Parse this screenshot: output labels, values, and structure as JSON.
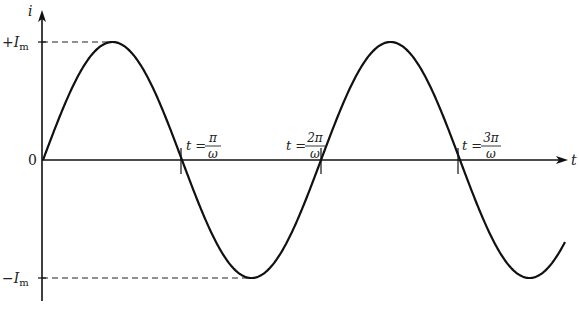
{
  "diagram": {
    "type": "sine-wave",
    "axes": {
      "y_label": "i",
      "x_label": "t",
      "y_ticks": [
        {
          "label_sign": "+",
          "label_sym": "I",
          "label_sub": "m",
          "value": "+Im"
        },
        {
          "label": "0",
          "value": 0
        },
        {
          "label_sign": "−",
          "label_sym": "I",
          "label_sub": "m",
          "value": "-Im"
        }
      ]
    },
    "annotations": [
      {
        "prefix": "t = ",
        "num": "π",
        "den": "ω"
      },
      {
        "prefix": "t = ",
        "num": "2π",
        "den": "ω"
      },
      {
        "prefix": "t = ",
        "num": "3π",
        "den": "ω"
      }
    ],
    "curve": "i = Im sin(ωt)",
    "colors": {
      "line": "#111111",
      "dash": "#222222"
    }
  }
}
